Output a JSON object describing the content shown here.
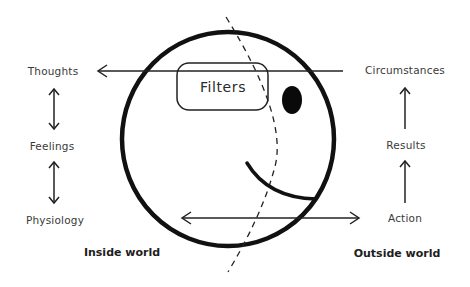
{
  "diagram": {
    "type": "concept-diagram",
    "colors": {
      "stroke": "#111111",
      "text": "#3a3a3a",
      "background": "#ffffff"
    },
    "inside": {
      "title": "Inside world",
      "items": [
        "Thoughts",
        "Feelings",
        "Physiology"
      ]
    },
    "outside": {
      "title": "Outside world",
      "items": [
        "Circumstances",
        "Results",
        "Action"
      ]
    },
    "center": {
      "shape": "smiley-face-circle",
      "filter_box_label": "Filters"
    },
    "connections": [
      {
        "from": "Circumstances",
        "to": "Thoughts",
        "style": "arrow",
        "through": "Filters"
      },
      {
        "from": "Thoughts",
        "to": "Feelings",
        "style": "double-arrow"
      },
      {
        "from": "Feelings",
        "to": "Physiology",
        "style": "double-arrow"
      },
      {
        "from": "Physiology",
        "to": "Action",
        "style": "double-arrow"
      },
      {
        "from": "Action",
        "to": "Results",
        "style": "arrow"
      },
      {
        "from": "Results",
        "to": "Circumstances",
        "style": "arrow"
      }
    ]
  }
}
